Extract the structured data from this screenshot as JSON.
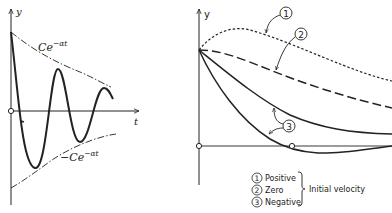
{
  "left_panel": {
    "y_axis_label": "y",
    "t_axis_label": "t",
    "upper_envelope_label": "Ce",
    "upper_envelope_exp": "−αt",
    "lower_envelope_label": "−Ce",
    "lower_envelope_exp": "−αt"
  },
  "right_panel": {
    "y_axis_label": "y",
    "markers": [
      "1",
      "2",
      "3"
    ],
    "legend": {
      "items": [
        {
          "number": "1",
          "label": "Positive"
        },
        {
          "number": "2",
          "label": "Zero"
        },
        {
          "number": "3",
          "label": "Negative"
        }
      ],
      "group_label": "Initial velocity"
    }
  },
  "colors": {
    "ink": "#222222",
    "background": "#ffffff"
  }
}
